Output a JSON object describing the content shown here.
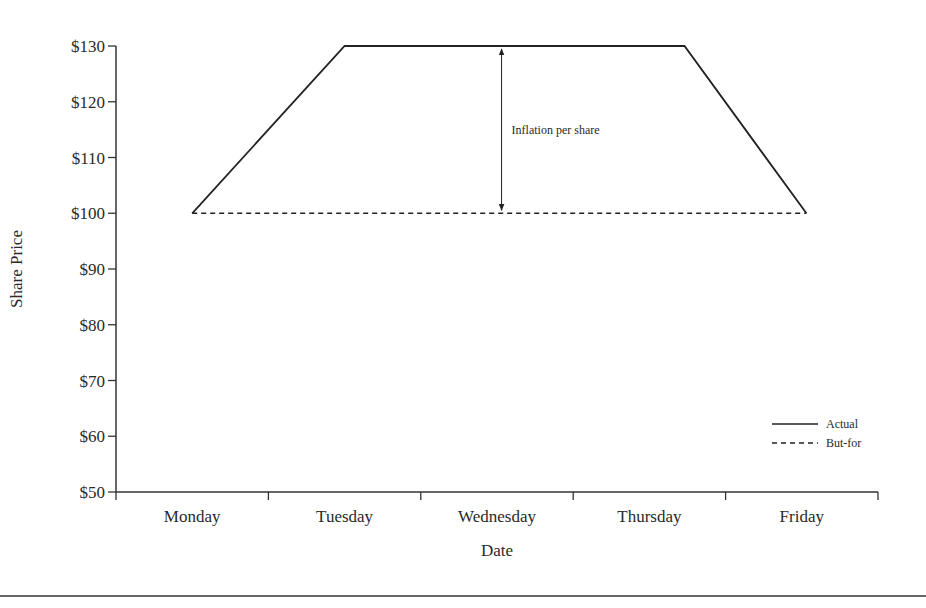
{
  "chart_data": {
    "type": "line",
    "title": "",
    "xlabel": "Date",
    "ylabel": "Share Price",
    "categories": [
      "Monday",
      "Tuesday",
      "Wednesday",
      "Thursday",
      "Friday"
    ],
    "ylim": [
      50,
      130
    ],
    "yticks": [
      50,
      60,
      70,
      80,
      90,
      100,
      110,
      120,
      130
    ],
    "ytick_labels": [
      "$50",
      "$60",
      "$70",
      "$80",
      "$90",
      "$100",
      "$110",
      "$120",
      "$130"
    ],
    "grid": false,
    "x_position_units": "category index; 0 = left edge of Monday band, each day spans 1 unit",
    "series": [
      {
        "name": "Actual",
        "style": "solid",
        "points": [
          {
            "x": 0.5,
            "y": 100
          },
          {
            "x": 1.5,
            "y": 130
          },
          {
            "x": 3.73,
            "y": 130
          },
          {
            "x": 4.53,
            "y": 100
          }
        ]
      },
      {
        "name": "But-for",
        "style": "dashed",
        "points": [
          {
            "x": 0.5,
            "y": 100
          },
          {
            "x": 4.53,
            "y": 100
          }
        ]
      }
    ],
    "annotations": [
      {
        "type": "double-arrow",
        "label": "Inflation per share",
        "x": 2.53,
        "y_from": 100,
        "y_to": 130
      }
    ],
    "legend": {
      "placement": "bottom-right",
      "entries": [
        {
          "label": "Actual",
          "style": "solid"
        },
        {
          "label": "But-for",
          "style": "dashed"
        }
      ]
    },
    "colors": {
      "line": "#222222",
      "text": "#2a2a2a",
      "axis": "#333333"
    }
  }
}
